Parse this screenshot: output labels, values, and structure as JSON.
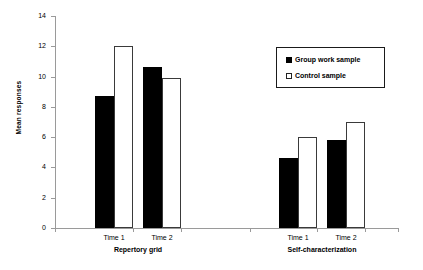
{
  "chart_data": {
    "type": "bar",
    "title": "",
    "xlabel": "",
    "ylabel": "Mean responses",
    "ylim": [
      0,
      14
    ],
    "ytick_values": [
      0,
      2,
      4,
      6,
      8,
      10,
      12,
      14
    ],
    "ytick_labels": [
      "0",
      "2",
      "4",
      "6",
      "8",
      "10",
      "12",
      "14"
    ],
    "grid": false,
    "legend_position": "upper right",
    "groups": [
      {
        "label": "Repertory grid",
        "categories": [
          "Time 1",
          "Time 2"
        ]
      },
      {
        "label": "Self-characterization",
        "categories": [
          "Time 1",
          "Time 2"
        ]
      }
    ],
    "categories": [
      "Repertory grid - Time 1",
      "Repertory grid - Time 2",
      "Self-characterization - Time 1",
      "Self-characterization - Time 2"
    ],
    "series": [
      {
        "name": "Group work sample",
        "style": "filled",
        "color": "#000000",
        "values": [
          8.7,
          10.6,
          4.6,
          5.8
        ]
      },
      {
        "name": "Control sample",
        "style": "hollow",
        "color": "#ffffff",
        "values": [
          12.0,
          9.9,
          6.0,
          7.0
        ]
      }
    ]
  },
  "legend": {
    "entries": [
      {
        "label": "Group work sample",
        "style": "filled"
      },
      {
        "label": "Control sample",
        "style": "hollow"
      }
    ]
  },
  "axis": {
    "y_title": "Mean responses"
  }
}
